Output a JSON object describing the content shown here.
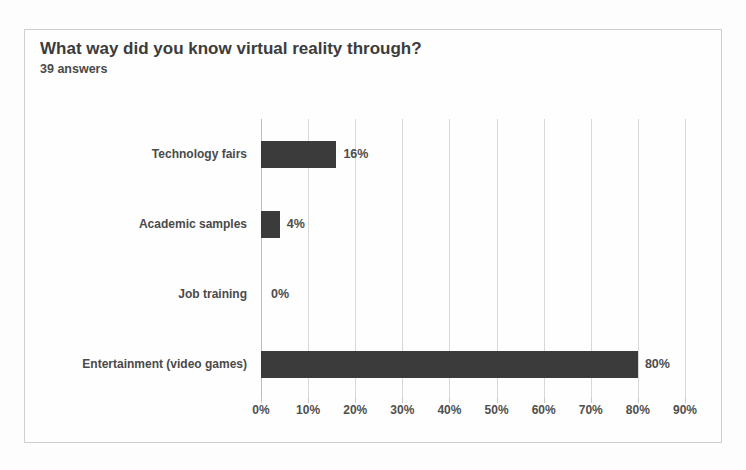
{
  "chart_data": {
    "type": "bar",
    "orientation": "horizontal",
    "title": "What way did you know virtual reality through?",
    "subtitle": "39 answers",
    "categories": [
      "Technology fairs",
      "Academic samples",
      "Job training",
      "Entertainment (video games)"
    ],
    "values": [
      16,
      4,
      0,
      80
    ],
    "data_labels": [
      "16%",
      "4%",
      "0%",
      "80%"
    ],
    "xlabel": "",
    "ylabel": "",
    "xlim": [
      0,
      90
    ],
    "xticks": [
      0,
      10,
      20,
      30,
      40,
      50,
      60,
      70,
      80,
      90
    ],
    "xtick_labels": [
      "0%",
      "10%",
      "20%",
      "30%",
      "40%",
      "50%",
      "60%",
      "70%",
      "80%",
      "90%"
    ],
    "grid": "vertical",
    "legend": "none",
    "bar_color": "#3b3b3b",
    "gridline_color": "#d8d8d8",
    "background_color": "#fefefe",
    "border_color": "#cfcfcf"
  }
}
